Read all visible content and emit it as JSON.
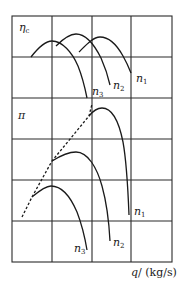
{
  "diagram": {
    "top_panel": {
      "y_label": "η",
      "y_label_sub": "c",
      "curves": [
        {
          "label": "n",
          "sub": "1"
        },
        {
          "label": "n",
          "sub": "2"
        },
        {
          "label": "n",
          "sub": "3"
        }
      ]
    },
    "bottom_panel": {
      "y_label": "π",
      "curves": [
        {
          "label": "n",
          "sub": "1"
        },
        {
          "label": "n",
          "sub": "2"
        },
        {
          "label": "n",
          "sub": "3"
        }
      ],
      "surge_line": "dashed"
    },
    "x_label_var": "q",
    "x_label_unit": "/ (kg/s)",
    "grid": {
      "columns": 4,
      "rows": 6
    },
    "colors": {
      "line": "#1a1a1a",
      "background": "#ffffff"
    }
  }
}
